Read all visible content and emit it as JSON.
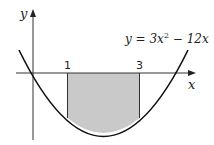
{
  "diagram": {
    "equation": "y = 3x² − 12x",
    "equation_parts": {
      "lhs": "y = 3x",
      "sup": "2",
      "rhs": " − 12x"
    },
    "x_axis_label": "x",
    "y_axis_label": "y",
    "bounds": [
      {
        "label": "1",
        "x": 1
      },
      {
        "label": "3",
        "x": 3
      }
    ],
    "shaded_region": "area between curve and x-axis from x = 1 to x = 3",
    "colors": {
      "shade": "#c9c9c9",
      "line": "#222222",
      "background": "#ffffff"
    }
  }
}
